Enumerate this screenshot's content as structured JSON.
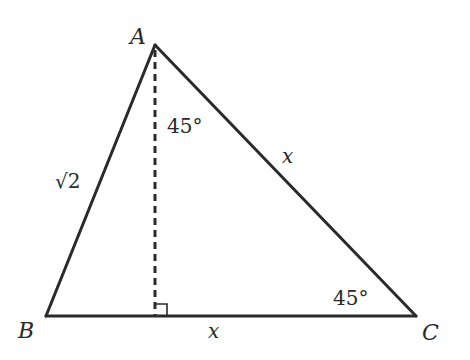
{
  "diagram": {
    "type": "triangle",
    "vertices": {
      "A": {
        "label": "A",
        "x": 155,
        "y": 45
      },
      "B": {
        "label": "B",
        "x": 46,
        "y": 316
      },
      "C": {
        "label": "C",
        "x": 416,
        "y": 316
      }
    },
    "altitude": {
      "from": "A",
      "foot_x": 155,
      "foot_y": 316,
      "style": "dashed",
      "right_angle_marker": true
    },
    "side_labels": {
      "AB": "√2",
      "AC": "x",
      "BC": "x"
    },
    "angle_labels": {
      "at_A_right_of_altitude": "45°",
      "at_C": "45°"
    },
    "colors": {
      "stroke": "#2a2a2a",
      "background": "#ffffff"
    }
  }
}
